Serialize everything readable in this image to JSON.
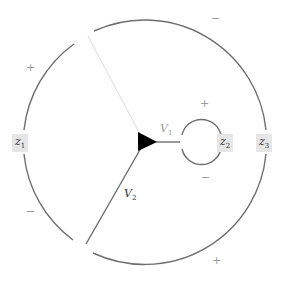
{
  "diagram": {
    "type": "contour-diagram",
    "colors": {
      "line": "#6e6e6e",
      "faint_line": "#e4e4e4",
      "vertex": "#000000",
      "label_bg": "#e6e6e6"
    },
    "labels": {
      "z1": {
        "base": "z",
        "sub": "1"
      },
      "z2": {
        "base": "z",
        "sub": "2"
      },
      "z3": {
        "base": "z",
        "sub": "3"
      },
      "v1": {
        "base": "V",
        "sub": "1"
      },
      "v2": {
        "base": "V",
        "sub": "2"
      }
    },
    "signs": {
      "outer_upper_left": "+",
      "outer_top_right": "−",
      "outer_lower_left": "−",
      "outer_bottom_right": "+",
      "inner_top": "+",
      "inner_bottom": "−"
    },
    "nodes": [
      {
        "id": "vertex",
        "shape": "triangle-right"
      }
    ]
  }
}
